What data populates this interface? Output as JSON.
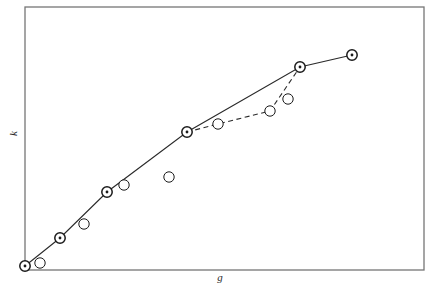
{
  "figure": {
    "background": "#ffffff",
    "width": 440,
    "height": 288
  },
  "axes": {
    "frame": {
      "left": 25,
      "top": 7,
      "right": 424,
      "bottom": 270,
      "color": "#767676",
      "line_width": 1.3
    },
    "xlabel": "g",
    "ylabel": "k",
    "top_clipped_label": "",
    "ticks": {
      "x": [],
      "y": [],
      "visible": false
    },
    "grid": false
  },
  "markers": {
    "filled_outer_radius": 5.2,
    "filled_inner_radius": 1.4,
    "open_radius": 5.2,
    "edge_color": "#1a1a1a",
    "face_color": "#ffffff",
    "dot_color": "#1a1a1a"
  },
  "lines": {
    "solid_color": "#2a2a2a",
    "solid_width": 1.1,
    "dashed_color": "#2a2a2a",
    "dashed_width": 1.1,
    "dash_pattern": "5,3.5"
  },
  "chart_data": {
    "type": "line",
    "title": "",
    "xlabel": "g",
    "ylabel": "k",
    "xlim": [
      25,
      424
    ],
    "ylim": [
      270,
      7
    ],
    "grid": false,
    "legend": null,
    "axis_tick_labels": {
      "x": [],
      "y": []
    },
    "note": "Pixel coordinates of the rendered figure; no numeric tick labels are printed on either axis.",
    "series": [
      {
        "name": "main-solid-branch",
        "style": "solid",
        "marker": "circle-with-center-dot",
        "points": [
          {
            "x": 25,
            "y": 266
          },
          {
            "x": 60,
            "y": 238
          },
          {
            "x": 107,
            "y": 192
          },
          {
            "x": 187,
            "y": 132
          },
          {
            "x": 300,
            "y": 67
          },
          {
            "x": 352,
            "y": 55
          }
        ]
      },
      {
        "name": "dashed-lower-branch",
        "style": "dashed",
        "marker": "open-circle",
        "points": [
          {
            "x": 187,
            "y": 132
          },
          {
            "x": 218,
            "y": 124
          },
          {
            "x": 270,
            "y": 111
          },
          {
            "x": 300,
            "y": 67
          }
        ]
      }
    ],
    "scatter_only_points": {
      "name": "unconnected-open-circles",
      "marker": "open-circle",
      "points": [
        {
          "x": 40,
          "y": 263
        },
        {
          "x": 84,
          "y": 224
        },
        {
          "x": 124,
          "y": 185
        },
        {
          "x": 169,
          "y": 177
        },
        {
          "x": 288,
          "y": 99
        }
      ]
    }
  }
}
